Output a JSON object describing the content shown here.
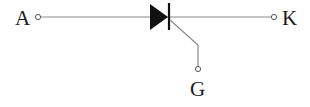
{
  "diagram": {
    "type": "circuit-symbol",
    "component": "thyristor",
    "terminals": [
      {
        "id": "anode",
        "label": "A"
      },
      {
        "id": "cathode",
        "label": "K"
      },
      {
        "id": "gate",
        "label": "G"
      }
    ],
    "colors": {
      "wire": "#8a8a8a",
      "symbol": "#111111",
      "text": "#1a1a1a"
    }
  }
}
